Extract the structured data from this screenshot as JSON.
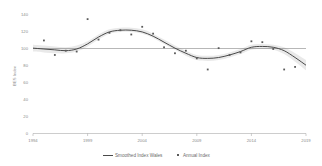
{
  "chart_data": {
    "type": "scatter",
    "title": "",
    "xlabel": "",
    "ylabel": "BES Index",
    "xlim": [
      1994,
      2019
    ],
    "ylim": [
      0,
      140
    ],
    "grid": false,
    "legend_position": "bottom",
    "xticks": [
      "1994",
      "1999",
      "2004",
      "2009",
      "2014",
      "2019"
    ],
    "yticks": [
      "0",
      "20",
      "40",
      "60",
      "80",
      "100",
      "120",
      "140"
    ],
    "reference_line": 100,
    "series": [
      {
        "name": "Annual Index",
        "type": "scatter",
        "x": [
          1995,
          1996,
          1997,
          1998,
          1999,
          2000,
          2001,
          2002,
          2003,
          2004,
          2005,
          2006,
          2007,
          2008,
          2009,
          2010,
          2011,
          2012,
          2013,
          2014,
          2015,
          2016,
          2017,
          2018
        ],
        "values": [
          109,
          92,
          97,
          96,
          134,
          110,
          118,
          121,
          116,
          125,
          117,
          101,
          94,
          97,
          88,
          75,
          100,
          92,
          95,
          108,
          107,
          99,
          75,
          78
        ]
      },
      {
        "name": "Smoothed Index Wales",
        "type": "line",
        "x": [
          1994,
          1995,
          1996,
          1997,
          1998,
          1999,
          2000,
          2001,
          2002,
          2003,
          2004,
          2005,
          2006,
          2007,
          2008,
          2009,
          2010,
          2011,
          2012,
          2013,
          2014,
          2015,
          2016,
          2017,
          2018,
          2019
        ],
        "values": [
          100,
          99,
          98,
          97,
          99,
          105,
          113,
          119,
          121,
          121,
          119,
          114,
          107,
          100,
          94,
          89,
          88,
          89,
          92,
          96,
          101,
          102,
          101,
          97,
          89,
          80
        ],
        "band_low": [
          96,
          95,
          94,
          94,
          96,
          102,
          110,
          117,
          119,
          119,
          117,
          112,
          105,
          98,
          91,
          86,
          85,
          86,
          89,
          93,
          98,
          99,
          98,
          93,
          84,
          74
        ],
        "band_high": [
          104,
          103,
          102,
          101,
          103,
          108,
          116,
          122,
          124,
          124,
          122,
          117,
          110,
          103,
          97,
          92,
          91,
          92,
          95,
          99,
          104,
          105,
          104,
          101,
          94,
          86
        ]
      }
    ],
    "legend": [
      {
        "label": "Smoothed Index Wales",
        "marker": "line"
      },
      {
        "label": "Annual Index",
        "marker": "square"
      }
    ],
    "colors": {
      "line": "#4a4a4a",
      "points": "#5a5a5a",
      "band": "#cfcfcf",
      "axis": "#9a9a9a",
      "text": "#8a8a8a"
    }
  }
}
